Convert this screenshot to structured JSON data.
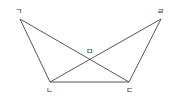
{
  "diagram": {
    "type": "geometry",
    "stroke_color": "#444444",
    "points": {
      "A": {
        "label": "ㄱ",
        "x": 20,
        "y": 19,
        "label_x": 15,
        "label_y": 14
      },
      "B": {
        "label": "ㄴ",
        "x": 50,
        "y": 82,
        "label_x": 46,
        "label_y": 93
      },
      "C": {
        "label": "ㄷ",
        "x": 129,
        "y": 82,
        "label_x": 126,
        "label_y": 93
      },
      "D": {
        "label": "ㄹ",
        "x": 161,
        "y": 19,
        "label_x": 157,
        "label_y": 14
      },
      "E": {
        "label": "ㅁ",
        "x": 90,
        "y": 59,
        "label_x": 86,
        "label_y": 54
      }
    },
    "segments": [
      [
        "ㄱ",
        "ㄴ"
      ],
      [
        "ㄴ",
        "ㄷ"
      ],
      [
        "ㄷ",
        "ㄹ"
      ],
      [
        "ㄱ",
        "ㄷ"
      ],
      [
        "ㄴ",
        "ㄹ"
      ]
    ]
  }
}
